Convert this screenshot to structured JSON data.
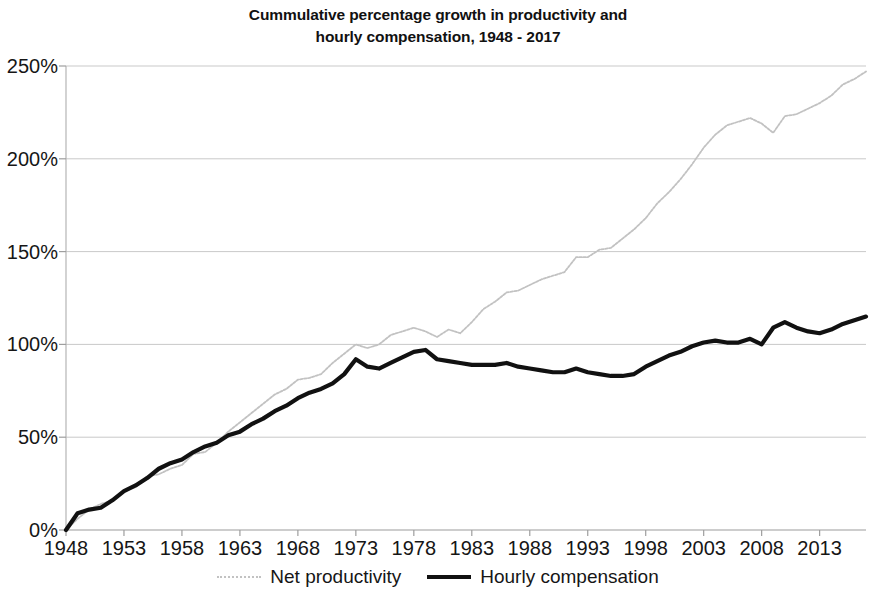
{
  "chart_data": {
    "type": "line",
    "title": "Cummulative percentage growth in productivity and hourly compensation, 1948 - 2017",
    "title_lines": [
      "Cummulative percentage growth in productivity and",
      "hourly compensation, 1948 - 2017"
    ],
    "xlabel": "",
    "ylabel": "",
    "xlim": [
      1948,
      2017
    ],
    "ylim": [
      0,
      250
    ],
    "grid": true,
    "grid_axis": "y",
    "legend_position": "bottom",
    "y_ticks": [
      0,
      50,
      100,
      150,
      200,
      250
    ],
    "y_tick_labels": [
      "0%",
      "50%",
      "100%",
      "150%",
      "200%",
      "250%"
    ],
    "x_ticks": [
      1948,
      1953,
      1958,
      1963,
      1968,
      1973,
      1978,
      1983,
      1988,
      1993,
      1998,
      2003,
      2008,
      2013
    ],
    "x_tick_labels": [
      "1948",
      "1953",
      "1958",
      "1963",
      "1968",
      "1973",
      "1978",
      "1983",
      "1988",
      "1993",
      "1998",
      "2003",
      "2008",
      "2013"
    ],
    "x": [
      1948,
      1949,
      1950,
      1951,
      1952,
      1953,
      1954,
      1955,
      1956,
      1957,
      1958,
      1959,
      1960,
      1961,
      1962,
      1963,
      1964,
      1965,
      1966,
      1967,
      1968,
      1969,
      1970,
      1971,
      1972,
      1973,
      1974,
      1975,
      1976,
      1977,
      1978,
      1979,
      1980,
      1981,
      1982,
      1983,
      1984,
      1985,
      1986,
      1987,
      1988,
      1989,
      1990,
      1991,
      1992,
      1993,
      1994,
      1995,
      1996,
      1997,
      1998,
      1999,
      2000,
      2001,
      2002,
      2003,
      2004,
      2005,
      2006,
      2007,
      2008,
      2009,
      2010,
      2011,
      2012,
      2013,
      2014,
      2015,
      2016,
      2017
    ],
    "series": [
      {
        "name": "Net productivity",
        "color": "#c2c2c2",
        "style": "thin-dotted",
        "values": [
          0,
          6,
          11,
          14,
          16,
          21,
          23,
          29,
          30,
          33,
          35,
          41,
          42,
          47,
          53,
          58,
          63,
          68,
          73,
          76,
          81,
          82,
          84,
          90,
          95,
          100,
          98,
          100,
          105,
          107,
          109,
          107,
          104,
          108,
          106,
          112,
          119,
          123,
          128,
          129,
          132,
          135,
          137,
          139,
          147,
          147,
          151,
          152,
          157,
          162,
          168,
          176,
          182,
          189,
          197,
          206,
          213,
          218,
          220,
          222,
          219,
          214,
          223,
          224,
          227,
          230,
          234,
          240,
          243,
          247
        ]
      },
      {
        "name": "Hourly compensation",
        "color": "#111111",
        "style": "thick-solid",
        "values": [
          0,
          9,
          11,
          12,
          16,
          21,
          24,
          28,
          33,
          36,
          38,
          42,
          45,
          47,
          51,
          53,
          57,
          60,
          64,
          67,
          71,
          74,
          76,
          79,
          84,
          92,
          88,
          87,
          90,
          93,
          96,
          97,
          92,
          91,
          90,
          89,
          89,
          89,
          90,
          88,
          87,
          86,
          85,
          85,
          87,
          85,
          84,
          83,
          83,
          84,
          88,
          91,
          94,
          96,
          99,
          101,
          102,
          101,
          101,
          103,
          100,
          109,
          112,
          109,
          107,
          106,
          108,
          111,
          113,
          115
        ]
      }
    ],
    "annotations": []
  },
  "legend": {
    "entries": [
      {
        "label": "Net productivity",
        "swatch": "thin"
      },
      {
        "label": "Hourly compensation",
        "swatch": "thick"
      }
    ]
  },
  "axes": {
    "y_axis_name": "cumulative-percent-growth",
    "x_axis_name": "year"
  }
}
